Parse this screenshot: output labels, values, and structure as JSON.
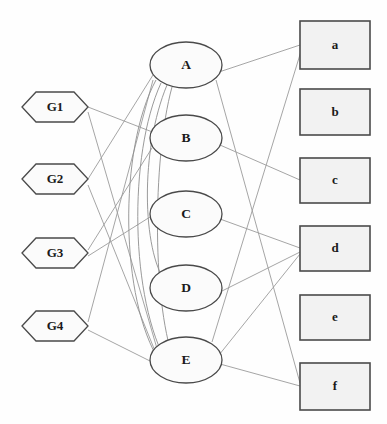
{
  "diagram": {
    "type": "tripartite-network-graph",
    "background_color": "#fefefe",
    "node_stroke_color": "#4a4a4a",
    "edge_color": "#9b9b9b",
    "rect_fill_color": "#f2f2f2",
    "columns": {
      "left": {
        "name": "gene-inputs",
        "shape": "hexagon",
        "nodes": [
          {
            "id": "G1",
            "label": "G1",
            "cx": 55,
            "cy": 107
          },
          {
            "id": "G2",
            "label": "G2",
            "cx": 55,
            "cy": 179
          },
          {
            "id": "G3",
            "label": "G3",
            "cx": 55,
            "cy": 253
          },
          {
            "id": "G4",
            "label": "G4",
            "cx": 55,
            "cy": 326
          }
        ]
      },
      "middle": {
        "name": "hidden-layer",
        "shape": "ellipse",
        "nodes": [
          {
            "id": "A",
            "label": "A",
            "cx": 186,
            "cy": 65
          },
          {
            "id": "B",
            "label": "B",
            "cx": 186,
            "cy": 138
          },
          {
            "id": "C",
            "label": "C",
            "cx": 186,
            "cy": 214
          },
          {
            "id": "D",
            "label": "D",
            "cx": 186,
            "cy": 288
          },
          {
            "id": "E",
            "label": "E",
            "cx": 186,
            "cy": 360
          }
        ]
      },
      "right": {
        "name": "outputs",
        "shape": "rectangle",
        "nodes": [
          {
            "id": "a",
            "label": "a",
            "cx": 335,
            "cy": 45
          },
          {
            "id": "b",
            "label": "b",
            "cx": 335,
            "cy": 112
          },
          {
            "id": "c",
            "label": "c",
            "cx": 335,
            "cy": 180
          },
          {
            "id": "d",
            "label": "d",
            "cx": 335,
            "cy": 248
          },
          {
            "id": "e",
            "label": "e",
            "cx": 335,
            "cy": 317
          },
          {
            "id": "f",
            "label": "f",
            "cx": 335,
            "cy": 386
          }
        ]
      }
    },
    "edges": [
      {
        "from": "G1",
        "to": "B"
      },
      {
        "from": "G1",
        "to": "E"
      },
      {
        "from": "G2",
        "to": "A"
      },
      {
        "from": "G2",
        "to": "E"
      },
      {
        "from": "G3",
        "to": "B"
      },
      {
        "from": "G3",
        "to": "C"
      },
      {
        "from": "G4",
        "to": "A"
      },
      {
        "from": "G4",
        "to": "E"
      },
      {
        "from": "A",
        "to": "E"
      },
      {
        "from": "A",
        "to": "D"
      },
      {
        "from": "A",
        "to": "a"
      },
      {
        "from": "A",
        "to": "f"
      },
      {
        "from": "B",
        "to": "c"
      },
      {
        "from": "C",
        "to": "d"
      },
      {
        "from": "D",
        "to": "d"
      },
      {
        "from": "E",
        "to": "a"
      },
      {
        "from": "E",
        "to": "d"
      },
      {
        "from": "E",
        "to": "f"
      }
    ]
  }
}
